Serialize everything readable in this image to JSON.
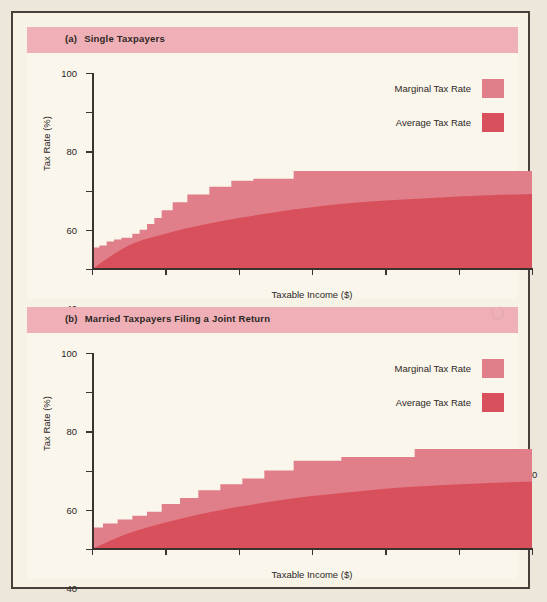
{
  "figure": {
    "background_color": "#f7f2e6",
    "frame_color": "#463f3a",
    "header_band_color": "#eeb0b6",
    "marginal_color": "#e07f89",
    "average_color": "#d8505c"
  },
  "panels": [
    {
      "tag": "(a)",
      "title": "Single Taxpayers",
      "legend": [
        {
          "label": "Marginal Tax Rate",
          "swatch": "marginal-swatch"
        },
        {
          "label": "Average Tax Rate",
          "swatch": "average-swatch"
        }
      ]
    },
    {
      "tag": "(b)",
      "title": "Married Taxpayers Filing a Joint Return",
      "legend": [
        {
          "label": "Marginal Tax Rate",
          "swatch": "marginal-swatch"
        },
        {
          "label": "Average Tax Rate",
          "swatch": "average-swatch"
        }
      ]
    }
  ],
  "chart_data": [
    {
      "type": "area",
      "title": "(a)  Single Taxpayers",
      "xlabel": "Taxable Income ($)",
      "ylabel": "Tax Rate (%)",
      "xlim": [
        0,
        120
      ],
      "ylim": [
        0,
        100
      ],
      "xticks": [
        0,
        20,
        40,
        60,
        80,
        100,
        120
      ],
      "yticks": [
        0,
        20,
        40,
        60,
        80,
        100
      ],
      "grid": false,
      "legend_position": "top-right",
      "series": [
        {
          "name": "Marginal Tax Rate",
          "style": "step",
          "color": "#e07f89",
          "steps": [
            {
              "x_start": 0,
              "x_end": 2,
              "value": 11
            },
            {
              "x_start": 2,
              "x_end": 4,
              "value": 12
            },
            {
              "x_start": 4,
              "x_end": 6,
              "value": 14
            },
            {
              "x_start": 6,
              "x_end": 8,
              "value": 15
            },
            {
              "x_start": 8,
              "x_end": 11,
              "value": 16
            },
            {
              "x_start": 11,
              "x_end": 13,
              "value": 18
            },
            {
              "x_start": 13,
              "x_end": 15,
              "value": 20
            },
            {
              "x_start": 15,
              "x_end": 17,
              "value": 23
            },
            {
              "x_start": 17,
              "x_end": 19,
              "value": 26
            },
            {
              "x_start": 19,
              "x_end": 22,
              "value": 30
            },
            {
              "x_start": 22,
              "x_end": 26,
              "value": 34
            },
            {
              "x_start": 26,
              "x_end": 32,
              "value": 38
            },
            {
              "x_start": 32,
              "x_end": 38,
              "value": 42
            },
            {
              "x_start": 38,
              "x_end": 44,
              "value": 45
            },
            {
              "x_start": 44,
              "x_end": 55,
              "value": 46
            },
            {
              "x_start": 55,
              "x_end": 120,
              "value": 50
            }
          ]
        },
        {
          "name": "Average Tax Rate",
          "style": "smooth-area",
          "color": "#d8505c",
          "x": [
            0,
            10,
            20,
            30,
            40,
            50,
            60,
            70,
            80,
            90,
            100,
            110,
            120
          ],
          "values": [
            0,
            12,
            18,
            22.5,
            26,
            29,
            31.5,
            33.5,
            35,
            36,
            37,
            37.7,
            38.3
          ]
        }
      ]
    },
    {
      "type": "area",
      "title": "(b)  Married Taxpayers Filing a Joint Return",
      "xlabel": "Taxable Income ($)",
      "ylabel": "Tax Rate (%)",
      "xlim": [
        0,
        120
      ],
      "ylim": [
        0,
        100
      ],
      "xticks": [
        0,
        20,
        40,
        60,
        80,
        100,
        120
      ],
      "yticks": [
        0,
        20,
        40,
        60,
        80,
        100
      ],
      "grid": false,
      "legend_position": "top-right",
      "series": [
        {
          "name": "Marginal Tax Rate",
          "style": "step",
          "color": "#e07f89",
          "steps": [
            {
              "x_start": 0,
              "x_end": 3,
              "value": 11
            },
            {
              "x_start": 3,
              "x_end": 7,
              "value": 13
            },
            {
              "x_start": 7,
              "x_end": 11,
              "value": 15
            },
            {
              "x_start": 11,
              "x_end": 15,
              "value": 17
            },
            {
              "x_start": 15,
              "x_end": 19,
              "value": 19
            },
            {
              "x_start": 19,
              "x_end": 24,
              "value": 23
            },
            {
              "x_start": 24,
              "x_end": 29,
              "value": 26
            },
            {
              "x_start": 29,
              "x_end": 35,
              "value": 30
            },
            {
              "x_start": 35,
              "x_end": 41,
              "value": 33
            },
            {
              "x_start": 41,
              "x_end": 47,
              "value": 36
            },
            {
              "x_start": 47,
              "x_end": 55,
              "value": 40
            },
            {
              "x_start": 55,
              "x_end": 68,
              "value": 45
            },
            {
              "x_start": 68,
              "x_end": 88,
              "value": 47
            },
            {
              "x_start": 88,
              "x_end": 120,
              "value": 51
            }
          ]
        },
        {
          "name": "Average Tax Rate",
          "style": "smooth-area",
          "color": "#d8505c",
          "x": [
            0,
            10,
            20,
            30,
            40,
            50,
            60,
            70,
            80,
            90,
            100,
            110,
            120
          ],
          "values": [
            0,
            8,
            13.5,
            18,
            21.5,
            24.5,
            27,
            29,
            30.8,
            32,
            33,
            33.8,
            34.5
          ]
        }
      ]
    }
  ]
}
